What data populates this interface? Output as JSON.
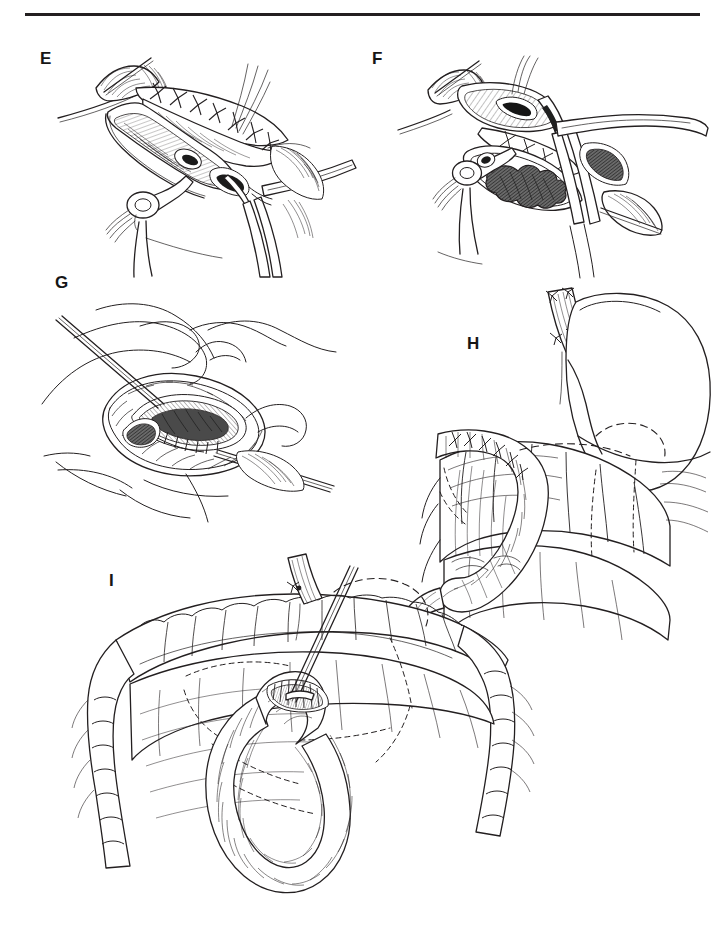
{
  "figure": {
    "kind": "surgical-atlas-line-illustration",
    "background_color": "#ffffff",
    "ink_color": "#231f20",
    "width": 722,
    "height": 941,
    "top_rule": {
      "visible": true,
      "color": "#231f20",
      "x": 25,
      "y": 13,
      "width": 675,
      "height": 3
    }
  },
  "panels": [
    {
      "id": "E",
      "label": "E",
      "label_x": 40,
      "label_y": 50,
      "subject": "opened viscus with running suture line, ring-handled retractor and clamp",
      "elements": [
        "interrupted-suture-row",
        "opened-lumen",
        "ring-handle-instrument",
        "tissue-clamp",
        "hatched-serosa-shading",
        "free-suture-strands"
      ]
    },
    {
      "id": "F",
      "label": "F",
      "label_x": 372,
      "label_y": 50,
      "subject": "exposed field with dark tumor mass, forceps and retractors",
      "elements": [
        "dark-tumor-mass",
        "ring-handle-instrument",
        "paired-retractor-blades",
        "suture-row",
        "hatched-serosa-shading",
        "free-suture-strands"
      ]
    },
    {
      "id": "G",
      "label": "G",
      "label_x": 55,
      "label_y": 274,
      "subject": "completed oval anastomosis with running inner suture and needle-held strands",
      "elements": [
        "oval-anastomosis-rim",
        "running-inner-suture",
        "curved-suture-strands",
        "straight-needle",
        "mucosal-ridges"
      ]
    },
    {
      "id": "H",
      "label": "H",
      "label_x": 467,
      "label_y": 335,
      "subject": "stomach remnant with esophageal stump sutures and Roux limb loop behind colon",
      "elements": [
        "stomach-body",
        "esophageal-stump-with-knots",
        "roux-limb-loop",
        "transverse-colon",
        "dashed-hidden-outline",
        "mesentery-shading"
      ]
    },
    {
      "id": "I",
      "label": "I",
      "label_x": 109,
      "label_y": 572,
      "subject": "colon frame with jejunal loop brought up and sutured, dashed retrocolic course",
      "elements": [
        "transverse-colon",
        "ascending-colon",
        "descending-colon",
        "jejunal-loop",
        "stapled-suture-patch",
        "dashed-hidden-outline",
        "traction-sutures"
      ]
    }
  ],
  "labels_order": [
    "E",
    "F",
    "G",
    "H",
    "I"
  ]
}
